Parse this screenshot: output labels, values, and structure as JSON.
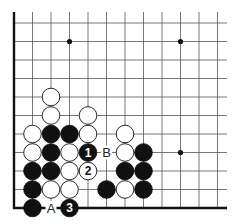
{
  "diagram": {
    "type": "go-board-fragment",
    "grid": {
      "origin_x": 14,
      "origin_y": 23,
      "spacing": 18.5,
      "cols": 12,
      "rows": 11,
      "line_color": "#555555",
      "edge_color": "#111111",
      "edges": [
        "left",
        "bottom"
      ]
    },
    "star_points": [
      {
        "col": 3,
        "row": 1
      },
      {
        "col": 9,
        "row": 1
      },
      {
        "col": 9,
        "row": 7
      }
    ],
    "stones": [
      {
        "col": 2,
        "row": 4,
        "color": "white"
      },
      {
        "col": 2,
        "row": 5,
        "color": "white"
      },
      {
        "col": 4,
        "row": 5,
        "color": "white"
      },
      {
        "col": 1,
        "row": 6,
        "color": "white"
      },
      {
        "col": 2,
        "row": 6,
        "color": "black"
      },
      {
        "col": 3,
        "row": 6,
        "color": "black"
      },
      {
        "col": 4,
        "row": 6,
        "color": "white"
      },
      {
        "col": 6,
        "row": 6,
        "color": "white"
      },
      {
        "col": 1,
        "row": 7,
        "color": "white"
      },
      {
        "col": 2,
        "row": 7,
        "color": "black"
      },
      {
        "col": 3,
        "row": 7,
        "color": "white"
      },
      {
        "col": 4,
        "row": 7,
        "color": "black",
        "number": "1"
      },
      {
        "col": 6,
        "row": 7,
        "color": "white"
      },
      {
        "col": 7,
        "row": 7,
        "color": "black"
      },
      {
        "col": 1,
        "row": 8,
        "color": "black"
      },
      {
        "col": 2,
        "row": 8,
        "color": "black"
      },
      {
        "col": 3,
        "row": 8,
        "color": "white"
      },
      {
        "col": 4,
        "row": 8,
        "color": "white",
        "number": "2"
      },
      {
        "col": 6,
        "row": 8,
        "color": "black"
      },
      {
        "col": 7,
        "row": 8,
        "color": "black"
      },
      {
        "col": 1,
        "row": 9,
        "color": "black"
      },
      {
        "col": 2,
        "row": 9,
        "color": "white"
      },
      {
        "col": 3,
        "row": 9,
        "color": "white"
      },
      {
        "col": 5,
        "row": 9,
        "color": "black"
      },
      {
        "col": 6,
        "row": 9,
        "color": "white"
      },
      {
        "col": 7,
        "row": 9,
        "color": "black"
      },
      {
        "col": 1,
        "row": 10,
        "color": "black"
      },
      {
        "col": 3,
        "row": 10,
        "color": "black",
        "number": "3"
      }
    ],
    "labels": [
      {
        "col": 2,
        "row": 10,
        "text": "A"
      },
      {
        "col": 5,
        "row": 7,
        "text": "B"
      }
    ]
  }
}
